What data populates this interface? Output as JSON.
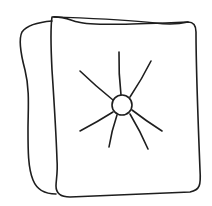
{
  "illustration": {
    "subject": "tufted cushion",
    "style": "line drawing",
    "colors": {
      "background": "#ffffff",
      "stroke": "#1e1e1e"
    },
    "stroke_width": 1.6,
    "tuft_button": {
      "cx": 122,
      "cy": 105,
      "r": 10
    },
    "rays": [
      {
        "x1": 121,
        "y1": 95,
        "x2": 119,
        "y2": 52
      },
      {
        "x1": 130,
        "y1": 97,
        "x2": 151,
        "y2": 61
      },
      {
        "x1": 113,
        "y1": 100,
        "x2": 80,
        "y2": 71
      },
      {
        "x1": 113,
        "y1": 112,
        "x2": 80,
        "y2": 131
      },
      {
        "x1": 117,
        "y1": 115,
        "x2": 109,
        "y2": 147
      },
      {
        "x1": 130,
        "y1": 114,
        "x2": 148,
        "y2": 149
      },
      {
        "x1": 132,
        "y1": 110,
        "x2": 162,
        "y2": 131
      }
    ]
  }
}
